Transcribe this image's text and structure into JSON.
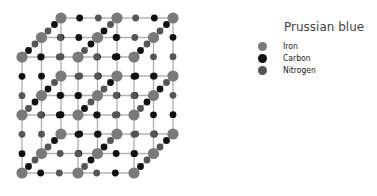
{
  "legend": {
    "title": "Prussian blue",
    "items": [
      {
        "label": "Iron",
        "color": "#7a7a7a"
      },
      {
        "label": "Carbon",
        "color": "#111111"
      },
      {
        "label": "Nitrogen",
        "color": "#555555"
      }
    ]
  },
  "lattice": {
    "line_color": "#b5b5b5",
    "iron_color": "#7a7a7a",
    "carbon_color": "#111111",
    "nitrogen_color": "#555555",
    "cells_per_axis": 2,
    "origin": [
      22,
      173
    ],
    "x_step": 56,
    "y_step": 58,
    "depth_step": [
      19.5,
      -19.5
    ]
  }
}
